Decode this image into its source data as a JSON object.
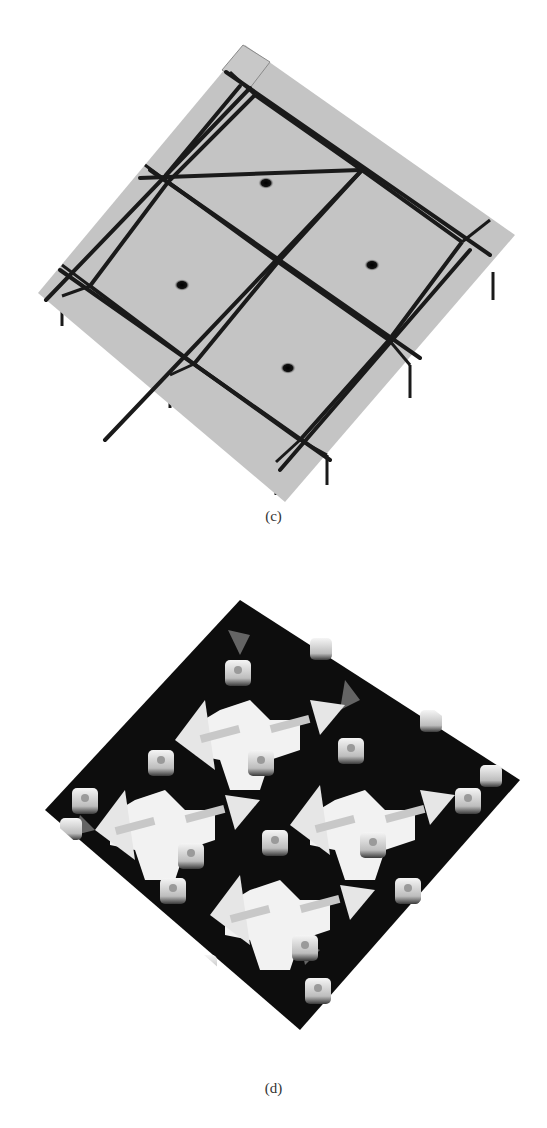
{
  "figure": {
    "panels": [
      {
        "id": "c",
        "caption": "(c)",
        "description": "3D rendered surface: tilted square slab divided into a 2x2 grid of square cells by dark grooves, each cell with a central hole; border strips along edges with posts hanging below",
        "colors": {
          "surface": "#c4c4c4",
          "groove": "#1a1a1a",
          "hole": "#111111"
        }
      },
      {
        "id": "d",
        "caption": "(d)",
        "description": "3D rendered surface: tilted square array of white raised structures (cross-shaped centers, triangular arrow shapes and small hollow posts) with deep black gaps, arranged in a 2x2 repeating pattern",
        "colors": {
          "structure": "#f2f2f2",
          "gap": "#0d0d0d",
          "mid": "#8a8a8a"
        }
      }
    ]
  }
}
